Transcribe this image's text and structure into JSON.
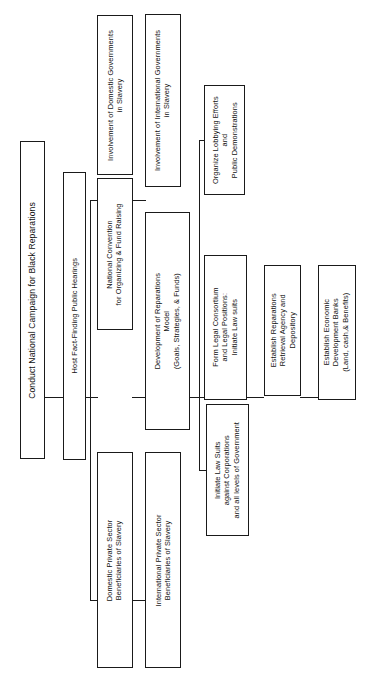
{
  "diagram": {
    "title": "Conduct National Campaign for Black Reparations",
    "orientation": "rotated-90-left",
    "nodes": {
      "root": "Conduct National Campaign for Black Reparations",
      "hearings": "Host Fact-Finding Public Hearings",
      "domestic_gov": "Involvement of Domestic Governments\nin Slavery",
      "international_gov": "Involvement of International Governments\nin Slavery",
      "convention": "National Convention\nfor Organizing & Fund Raising",
      "domestic_private": "Domestic Private Sector\nBeneficiaries of Slavery",
      "international_private": "International Private Sector\nBeneficiaries of Slavery",
      "reparations_model": "Development of Reparations\nModel\n(Goals, Strategies, & Funds)",
      "lobbying": "Organize Lobbying Efforts\nand\nPublic Demonstrations",
      "legal_consortium": "Form Legal Consortium\nand Legal Positions:\nInitiate Law suits",
      "law_suits": "Initiate Law Suits\nagainst Corporations\nand all levels of Government",
      "retrieval_agency": "Establish Reparations\nRetrieval Agency and\nDepository",
      "development_banks": "Establish Economic\nDevelopment Banks\n(Land, cash,& Benefits)"
    },
    "node_lines": {
      "root": [
        "Conduct National Campaign for Black Reparations"
      ],
      "hearings": [
        "Host Fact-Finding Public Hearings"
      ],
      "domestic_gov": [
        "Involvement of Domestic Governments",
        "in Slavery"
      ],
      "international_gov": [
        "Involvement of International Governments",
        "in Slavery"
      ],
      "convention": [
        "National Convention",
        "for Organizing & Fund Raising"
      ],
      "domestic_private": [
        "Domestic Private Sector",
        "Beneficiaries of Slavery"
      ],
      "international_private": [
        "International Private Sector",
        "Beneficiaries of Slavery"
      ],
      "reparations_model": [
        "Development of Reparations",
        "Model",
        "(Goals, Strategies, & Funds)"
      ],
      "lobbying": [
        "Organize Lobbying Efforts",
        "and",
        "Public Demonstrations"
      ],
      "legal_consortium": [
        "Form Legal Consortium",
        "and Legal Positions:",
        "Initiate Law suits"
      ],
      "law_suits": [
        "Initiate Law Suits",
        "against Corporations",
        "and all levels of Government"
      ],
      "retrieval_agency": [
        "Establish Reparations",
        "Retrieval Agency and",
        "Depository"
      ],
      "development_banks": [
        "Establish Economic",
        "Development Banks",
        "(Land, cash,& Benefits)"
      ]
    },
    "colors": {
      "stroke": "#1a1a1a",
      "fill": "#ffffff",
      "text": "#111111"
    }
  }
}
